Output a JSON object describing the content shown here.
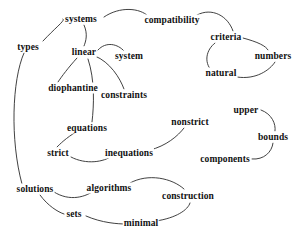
{
  "diagram": {
    "type": "concept-graph",
    "title": "",
    "background_color": "#ffffff",
    "text_color": "#111111",
    "edge_color": "#2b2b2b",
    "width": 300,
    "height": 240,
    "nodes": [
      {
        "id": "types",
        "label": "types",
        "x": 28,
        "y": 47
      },
      {
        "id": "systems",
        "label": "systems",
        "x": 81,
        "y": 19
      },
      {
        "id": "compatibility",
        "label": "compatibility",
        "x": 172,
        "y": 20
      },
      {
        "id": "linear",
        "label": "linear",
        "x": 84,
        "y": 52
      },
      {
        "id": "system",
        "label": "system",
        "x": 129,
        "y": 56
      },
      {
        "id": "criteria",
        "label": "criteria",
        "x": 226,
        "y": 37
      },
      {
        "id": "numbers",
        "label": "numbers",
        "x": 273,
        "y": 56
      },
      {
        "id": "natural",
        "label": "natural",
        "x": 221,
        "y": 73
      },
      {
        "id": "diophantine",
        "label": "diophantine",
        "x": 73,
        "y": 88
      },
      {
        "id": "constraints",
        "label": "constraints",
        "x": 124,
        "y": 95
      },
      {
        "id": "equations",
        "label": "equations",
        "x": 87,
        "y": 128
      },
      {
        "id": "nonstrict",
        "label": "nonstrict",
        "x": 190,
        "y": 122
      },
      {
        "id": "upper",
        "label": "upper",
        "x": 246,
        "y": 110
      },
      {
        "id": "bounds",
        "label": "bounds",
        "x": 273,
        "y": 137
      },
      {
        "id": "strict",
        "label": "strict",
        "x": 58,
        "y": 153
      },
      {
        "id": "inequations",
        "label": "inequations",
        "x": 129,
        "y": 153
      },
      {
        "id": "components",
        "label": "components",
        "x": 225,
        "y": 159
      },
      {
        "id": "solutions",
        "label": "solutions",
        "x": 35,
        "y": 189
      },
      {
        "id": "algorithms",
        "label": "algorithms",
        "x": 109,
        "y": 188
      },
      {
        "id": "construction",
        "label": "construction",
        "x": 188,
        "y": 196
      },
      {
        "id": "sets",
        "label": "sets",
        "x": 74,
        "y": 214
      },
      {
        "id": "minimal",
        "label": "minimal",
        "x": 141,
        "y": 223
      }
    ],
    "edges": [
      {
        "from": "types",
        "to": "systems",
        "path": "M 43 41 C 56 27 66 20 63 19"
      },
      {
        "from": "systems",
        "to": "compatibility",
        "path": "M 104 17 C 120 6 140 8 148 16"
      },
      {
        "from": "systems",
        "to": "linear",
        "path": "M 84 25 C 88 34 86 41 84 46"
      },
      {
        "from": "linear",
        "to": "system",
        "path": "M 98 50 C 106 41 118 44 124 51"
      },
      {
        "from": "linear",
        "to": "diophantine",
        "path": "M 77 58 C 68 68 62 76 58 82"
      },
      {
        "from": "linear",
        "to": "constraints",
        "path": "M 95 56 C 110 62 120 78 124 89"
      },
      {
        "from": "linear",
        "to": "equations",
        "path": "M 88 59 C 95 80 94 105 92 122"
      },
      {
        "from": "compatibility",
        "to": "criteria",
        "path": "M 197 15 C 212 7 228 16 233 31"
      },
      {
        "from": "criteria",
        "to": "numbers",
        "path": "M 243 38 C 258 42 266 46 268 50"
      },
      {
        "from": "criteria",
        "to": "natural",
        "path": "M 215 43 C 206 50 204 62 211 70"
      },
      {
        "from": "natural",
        "to": "numbers",
        "path": "M 237 77 C 256 80 270 70 275 62"
      },
      {
        "from": "types",
        "to": "solutions",
        "path": "M 24 53 C 12 80 10 140 22 184"
      },
      {
        "from": "equations",
        "to": "strict",
        "path": "M 76 132 C 66 138 60 144 57 147"
      },
      {
        "from": "strict",
        "to": "inequations",
        "path": "M 71 157 C 86 165 104 162 112 156"
      },
      {
        "from": "inequations",
        "to": "nonstrict",
        "path": "M 150 150 C 166 146 178 136 184 128"
      },
      {
        "from": "upper",
        "to": "bounds",
        "path": "M 261 110 C 272 114 276 124 275 131"
      },
      {
        "from": "bounds",
        "to": "components",
        "path": "M 273 143 C 272 152 264 160 252 159"
      },
      {
        "from": "solutions",
        "to": "algorithms",
        "path": "M 54 192 C 70 202 86 197 95 190"
      },
      {
        "from": "solutions",
        "to": "sets",
        "path": "M 40 195 C 48 206 58 212 64 214"
      },
      {
        "from": "algorithms",
        "to": "construction",
        "path": "M 130 183 C 148 173 172 178 184 189"
      },
      {
        "from": "sets",
        "to": "minimal",
        "path": "M 86 216 C 102 223 118 224 126 224"
      },
      {
        "from": "minimal",
        "to": "construction",
        "path": "M 156 221 C 176 218 188 210 190 203"
      }
    ]
  }
}
